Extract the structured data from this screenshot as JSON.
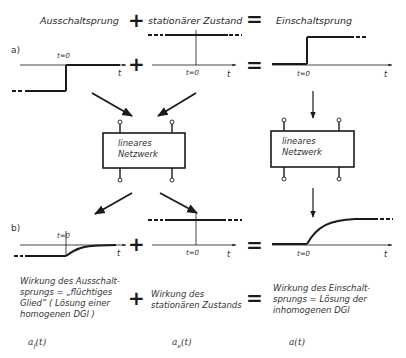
{
  "header": {
    "term1": "Ausschaltsprung",
    "plus": "+",
    "term2": "stationärer Zustand",
    "equals": "=",
    "term3": "Einschaltsprung"
  },
  "row_a": {
    "label": "a)",
    "plot_left": {
      "t0_label": "t=0",
      "axis_label": "t"
    },
    "plus": "+",
    "plot_middle": {
      "t0_label": "t=0",
      "axis_label": "t"
    },
    "equals": "=",
    "plot_right": {
      "t0_label": "t=0",
      "axis_label": "t"
    }
  },
  "networks": {
    "left": {
      "text": "lineares\nNetzwerk"
    },
    "right": {
      "text": "lineares\nNetzwerk"
    }
  },
  "row_b": {
    "label": "b)",
    "plot_left": {
      "t0_label": "t=0",
      "axis_label": "t"
    },
    "plus": "+",
    "plot_middle": {
      "t0_label": "t=0",
      "axis_label": "t"
    },
    "equals": "=",
    "plot_right": {
      "t0_label": "t=0",
      "axis_label": "t"
    }
  },
  "descriptions": {
    "left": "Wirkung des Ausschalt-\nsprungs = „flüchtiges\nGlied“ ( Lösung einer\nhomogenen DGl )",
    "plus": "+",
    "middle": "Wirkung des\nstationären Zustands",
    "equals": "=",
    "right": "Wirkung des Einschalt-\nsprungs = Lösung der\ninhomogenen DGl"
  },
  "functions": {
    "left": "a_f(t)",
    "left_main": "a",
    "left_sub": "f",
    "left_arg": "(t)",
    "middle_main": "a",
    "middle_sub": "e",
    "middle_arg": "(t)",
    "right": "a(t)"
  },
  "colors": {
    "ink": "#1a1a1a",
    "background": "#ffffff"
  }
}
